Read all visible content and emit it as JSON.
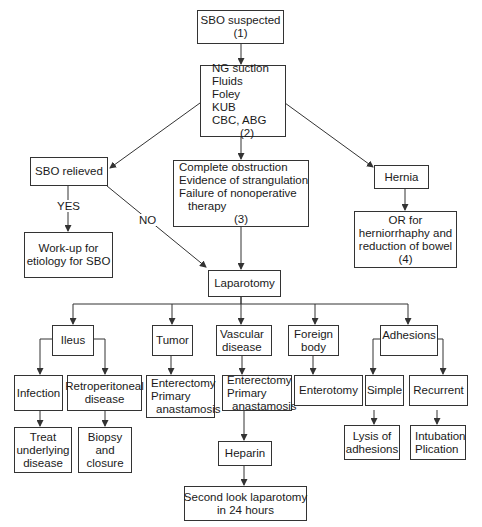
{
  "diagram": {
    "type": "flowchart",
    "topic": "Small bowel obstruction management algorithm",
    "nodes": {
      "sbo_suspected": {
        "lines": [
          "SBO suspected",
          "(1)"
        ]
      },
      "initial_workup": {
        "lines": [
          "NG suction",
          "Fluids",
          "Foley",
          "KUB",
          "CBC, ABG",
          "(2)"
        ]
      },
      "sbo_relieved": {
        "lines": [
          "SBO relieved"
        ]
      },
      "surgical_indications": {
        "lines": [
          "Complete obstruction",
          "Evidence of strangulation",
          "Failure of nonoperative",
          "therapy",
          "(3)"
        ]
      },
      "hernia": {
        "lines": [
          "Hernia"
        ]
      },
      "or_hernia": {
        "lines": [
          "OR for",
          "herniorrhaphy and",
          "reduction of bowel",
          "(4)"
        ]
      },
      "workup_etiology": {
        "lines": [
          "Work-up for",
          "etiology for SBO"
        ]
      },
      "laparotomy": {
        "lines": [
          "Laparotomy"
        ]
      },
      "ileus": {
        "lines": [
          "Ileus"
        ]
      },
      "tumor": {
        "lines": [
          "Tumor"
        ]
      },
      "vascular_disease": {
        "lines": [
          "Vascular",
          "disease"
        ]
      },
      "foreign_body": {
        "lines": [
          "Foreign",
          "body"
        ]
      },
      "adhesions": {
        "lines": [
          "Adhesions"
        ]
      },
      "infection": {
        "lines": [
          "Infection"
        ]
      },
      "retroperitoneal": {
        "lines": [
          "Retroperitoneal",
          "disease"
        ]
      },
      "tumor_tx": {
        "lines": [
          "Enterectomy",
          "Primary",
          "anastamosis"
        ]
      },
      "vascular_tx": {
        "lines": [
          "Enterectomy",
          "Primary",
          "anastamosis"
        ]
      },
      "enterotomy": {
        "lines": [
          "Enterotomy"
        ]
      },
      "simple": {
        "lines": [
          "Simple"
        ]
      },
      "recurrent": {
        "lines": [
          "Recurrent"
        ]
      },
      "treat_underlying": {
        "lines": [
          "Treat",
          "underlying",
          "disease"
        ]
      },
      "biopsy_closure": {
        "lines": [
          "Biopsy",
          "and",
          "closure"
        ]
      },
      "heparin": {
        "lines": [
          "Heparin"
        ]
      },
      "lysis": {
        "lines": [
          "Lysis of",
          "adhesions"
        ]
      },
      "intubation": {
        "lines": [
          "Intubation",
          "Plication"
        ]
      },
      "second_look": {
        "lines": [
          "Second look laparotomy",
          "in 24 hours"
        ]
      }
    },
    "edge_labels": {
      "yes": "YES",
      "no": "NO"
    },
    "edges": [
      [
        "sbo_suspected",
        "initial_workup"
      ],
      [
        "initial_workup",
        "sbo_relieved"
      ],
      [
        "initial_workup",
        "surgical_indications"
      ],
      [
        "initial_workup",
        "hernia"
      ],
      [
        "sbo_relieved",
        "workup_etiology",
        "YES"
      ],
      [
        "sbo_relieved",
        "laparotomy",
        "NO"
      ],
      [
        "surgical_indications",
        "laparotomy"
      ],
      [
        "hernia",
        "or_hernia"
      ],
      [
        "laparotomy",
        "ileus"
      ],
      [
        "laparotomy",
        "tumor"
      ],
      [
        "laparotomy",
        "vascular_disease"
      ],
      [
        "laparotomy",
        "foreign_body"
      ],
      [
        "laparotomy",
        "adhesions"
      ],
      [
        "ileus",
        "infection"
      ],
      [
        "ileus",
        "retroperitoneal"
      ],
      [
        "tumor",
        "tumor_tx"
      ],
      [
        "vascular_disease",
        "vascular_tx"
      ],
      [
        "foreign_body",
        "enterotomy"
      ],
      [
        "adhesions",
        "simple"
      ],
      [
        "adhesions",
        "recurrent"
      ],
      [
        "infection",
        "treat_underlying"
      ],
      [
        "retroperitoneal",
        "biopsy_closure"
      ],
      [
        "vascular_tx",
        "heparin"
      ],
      [
        "heparin",
        "second_look"
      ],
      [
        "simple",
        "lysis"
      ],
      [
        "recurrent",
        "intubation"
      ]
    ]
  },
  "colors": {
    "line": "#333333",
    "text": "#1a1a1a",
    "background": "#ffffff"
  }
}
